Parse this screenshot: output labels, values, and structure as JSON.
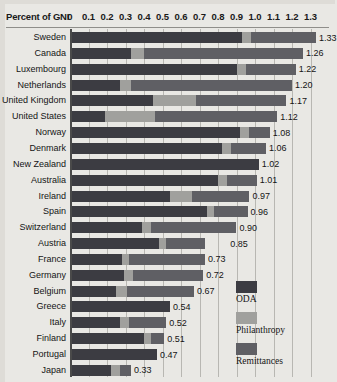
{
  "chart_data": {
    "type": "bar",
    "orientation": "horizontal",
    "stacked": true,
    "title": "",
    "xlabel": "Percent of GNI",
    "ylabel": "",
    "xlim": [
      0,
      1.35
    ],
    "xticks": [
      0,
      0.1,
      0.2,
      0.3,
      0.4,
      0.5,
      0.6,
      0.7,
      0.8,
      0.9,
      1.0,
      1.1,
      1.2,
      1.3
    ],
    "xticklabels": [
      "0",
      "0.1",
      "0.2",
      "0.3",
      "0.4",
      "0.5",
      "0.6",
      "0.7",
      "0.8",
      "0.9",
      "1.0",
      "1.1",
      "1.2",
      "1.3"
    ],
    "grid": true,
    "legend_position": "inside-bottom-right",
    "legend": [
      "ODA",
      "Philanthropy",
      "Remittances"
    ],
    "series": [
      {
        "name": "ODA",
        "color": "#3c3c42",
        "values": [
          0.93,
          0.33,
          0.9,
          0.27,
          0.45,
          0.19,
          0.92,
          0.82,
          1.02,
          0.8,
          0.54,
          0.74,
          0.39,
          0.48,
          0.28,
          0.29,
          0.25,
          0.54,
          0.27,
          0.4,
          0.47,
          0.22
        ]
      },
      {
        "name": "Philanthropy",
        "color": "#a0a09d",
        "values": [
          0.05,
          0.07,
          0.05,
          0.06,
          0.23,
          0.27,
          0.05,
          0.05,
          0.0,
          0.05,
          0.12,
          0.04,
          0.05,
          0.04,
          0.04,
          0.05,
          0.06,
          0.0,
          0.05,
          0.04,
          0.0,
          0.05
        ]
      },
      {
        "name": "Remittances",
        "color": "#5f5f64",
        "values": [
          0.35,
          0.86,
          0.27,
          0.87,
          0.49,
          0.66,
          0.11,
          0.19,
          0.0,
          0.16,
          0.31,
          0.18,
          0.46,
          0.21,
          0.41,
          0.38,
          0.36,
          0.0,
          0.2,
          0.07,
          0.0,
          0.06
        ]
      }
    ],
    "categories": [
      "Sweden",
      "Canada",
      "Luxembourg",
      "Netherlands",
      "United Kingdom",
      "United States",
      "Norway",
      "Denmark",
      "New Zealand",
      "Australia",
      "Ireland",
      "Spain",
      "Switzerland",
      "Austria",
      "France",
      "Germany",
      "Belgium",
      "Greece",
      "Italy",
      "Finland",
      "Portugal",
      "Japan"
    ],
    "totals": [
      1.33,
      1.26,
      1.22,
      1.2,
      1.17,
      1.12,
      1.08,
      1.06,
      1.02,
      1.01,
      0.97,
      0.96,
      0.9,
      0.85,
      0.73,
      0.72,
      0.67,
      0.54,
      0.52,
      0.51,
      0.47,
      0.33
    ],
    "total_labels": [
      "1.33",
      "1.26",
      "1.22",
      "1.20",
      "1.17",
      "1.12",
      "1.08",
      "1.06",
      "1.02",
      "1.01",
      "0.97",
      "0.96",
      "0.90",
      "0.85",
      "0.73",
      "0.72",
      "0.67",
      "0.54",
      "0.52",
      "0.51",
      "0.47",
      "0.33"
    ]
  },
  "colors": {
    "background": "#e9e8e4",
    "oda": "#3c3c42",
    "philanthropy": "#a0a09d",
    "remittances": "#5f5f64",
    "gridline": "#b8b7b2",
    "axis": "#4a4a4a",
    "text": "#141414"
  },
  "legend": {
    "items": [
      {
        "label": "ODA",
        "key": "oda"
      },
      {
        "label": "Philanthropy",
        "key": "phil"
      },
      {
        "label": "Remittances",
        "key": "rem"
      }
    ]
  }
}
